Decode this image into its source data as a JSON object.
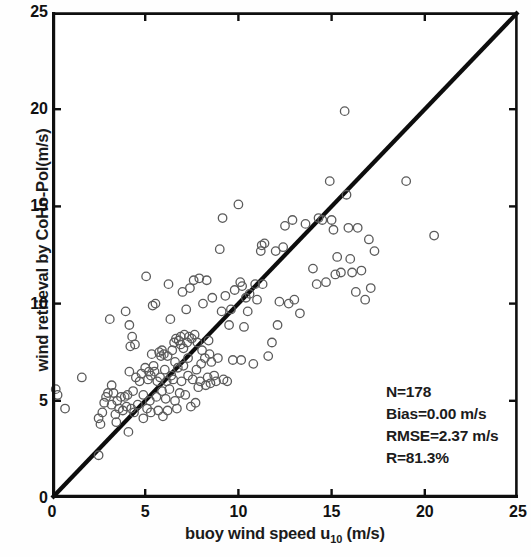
{
  "chart_data": {
    "type": "scatter",
    "title": "",
    "xlabel": "buoy wind speed u10 (m/s)",
    "xlabel_main": "buoy wind speed u",
    "xlabel_sub": "10",
    "xlabel_unit": " (m/s)",
    "ylabel": "wind retrieval by CoHo-Pol(m/s)",
    "xlim": [
      0,
      25
    ],
    "ylim": [
      0,
      25
    ],
    "xticks": [
      0,
      5,
      10,
      15,
      20,
      25
    ],
    "yticks": [
      0,
      5,
      10,
      15,
      20,
      25
    ],
    "xtick_labels": [
      "0",
      "5",
      "10",
      "15",
      "20",
      "25"
    ],
    "ytick_labels": [
      "0",
      "5",
      "10",
      "15",
      "20",
      "25"
    ],
    "grid": false,
    "legend": null,
    "marker": {
      "shape": "open-circle",
      "diameter_px": 8.5,
      "stroke": "#5b5b5b",
      "stroke_width": 1.3,
      "fill": "none"
    },
    "reference_line": {
      "name": "one-to-one line",
      "from": [
        0,
        0
      ],
      "to": [
        25,
        25
      ],
      "color": "#0d0d0d",
      "width_px": 4.2
    },
    "annotations": [
      "N=178",
      "Bias=0.00 m/s",
      "RMSE=2.37 m/s",
      "R=81.3%"
    ],
    "stats": {
      "n_label": "N=178",
      "bias_label": "Bias=0.00 m/s",
      "rmse_label": "RMSE=2.37 m/s",
      "r_label": "R=81.3%",
      "n": 178,
      "bias": 0.0,
      "rmse": 2.37,
      "r_percent": 81.3
    },
    "points": [
      [
        0.2,
        5.6
      ],
      [
        0.3,
        5.3
      ],
      [
        0.7,
        4.6
      ],
      [
        1.6,
        6.2
      ],
      [
        2.5,
        4.1
      ],
      [
        2.5,
        2.2
      ],
      [
        2.6,
        3.8
      ],
      [
        2.7,
        4.4
      ],
      [
        2.9,
        5.2
      ],
      [
        3.0,
        5.4
      ],
      [
        3.1,
        9.2
      ],
      [
        3.2,
        4.8
      ],
      [
        3.3,
        5.4
      ],
      [
        3.4,
        4.3
      ],
      [
        3.5,
        5.0
      ],
      [
        3.6,
        4.6
      ],
      [
        3.7,
        5.2
      ],
      [
        3.8,
        4.5
      ],
      [
        3.9,
        5.2
      ],
      [
        3.95,
        9.6
      ],
      [
        4.0,
        4.7
      ],
      [
        4.05,
        5.3
      ],
      [
        4.1,
        3.4
      ],
      [
        4.15,
        8.9
      ],
      [
        4.2,
        7.8
      ],
      [
        4.25,
        4.6
      ],
      [
        4.3,
        8.3
      ],
      [
        4.35,
        5.5
      ],
      [
        4.4,
        4.4
      ],
      [
        4.5,
        6.2
      ],
      [
        4.6,
        4.8
      ],
      [
        4.7,
        6.0
      ],
      [
        4.8,
        6.4
      ],
      [
        4.9,
        5.3
      ],
      [
        5.0,
        6.7
      ],
      [
        5.05,
        11.4
      ],
      [
        5.1,
        4.6
      ],
      [
        5.15,
        6.1
      ],
      [
        5.2,
        6.5
      ],
      [
        5.25,
        5.0
      ],
      [
        5.3,
        6.3
      ],
      [
        5.35,
        7.4
      ],
      [
        5.4,
        9.9
      ],
      [
        5.5,
        6.5
      ],
      [
        5.55,
        10.0
      ],
      [
        5.6,
        5.2
      ],
      [
        5.65,
        6.0
      ],
      [
        5.7,
        4.5
      ],
      [
        5.75,
        7.5
      ],
      [
        5.8,
        6.2
      ],
      [
        5.85,
        7.3
      ],
      [
        5.9,
        5.5
      ],
      [
        5.95,
        4.2
      ],
      [
        6.0,
        7.4
      ],
      [
        6.05,
        6.6
      ],
      [
        6.1,
        5.1
      ],
      [
        6.15,
        6.0
      ],
      [
        6.2,
        7.3
      ],
      [
        6.25,
        11.0
      ],
      [
        6.3,
        5.6
      ],
      [
        6.35,
        9.2
      ],
      [
        6.4,
        6.3
      ],
      [
        6.5,
        6.1
      ],
      [
        6.55,
        8.0
      ],
      [
        6.6,
        5.0
      ],
      [
        6.65,
        8.2
      ],
      [
        6.7,
        4.6
      ],
      [
        6.75,
        6.7
      ],
      [
        6.8,
        8.1
      ],
      [
        6.85,
        5.4
      ],
      [
        6.9,
        8.3
      ],
      [
        6.95,
        6.0
      ],
      [
        7.0,
        10.6
      ],
      [
        7.05,
        6.8
      ],
      [
        7.1,
        8.4
      ],
      [
        7.15,
        5.3
      ],
      [
        7.2,
        9.7
      ],
      [
        7.25,
        8.0
      ],
      [
        7.3,
        6.3
      ],
      [
        7.35,
        8.3
      ],
      [
        7.4,
        10.8
      ],
      [
        7.45,
        4.7
      ],
      [
        7.5,
        8.2
      ],
      [
        7.55,
        6.1
      ],
      [
        7.6,
        11.2
      ],
      [
        7.65,
        8.4
      ],
      [
        7.7,
        4.9
      ],
      [
        7.75,
        6.6
      ],
      [
        7.8,
        8.0
      ],
      [
        7.85,
        5.7
      ],
      [
        7.9,
        11.3
      ],
      [
        7.95,
        6.0
      ],
      [
        8.0,
        6.9
      ],
      [
        8.1,
        10.0
      ],
      [
        8.2,
        7.2
      ],
      [
        8.25,
        5.8
      ],
      [
        8.3,
        11.2
      ],
      [
        8.35,
        6.2
      ],
      [
        8.4,
        8.1
      ],
      [
        8.5,
        5.9
      ],
      [
        8.55,
        7.0
      ],
      [
        8.6,
        10.3
      ],
      [
        8.7,
        6.3
      ],
      [
        8.8,
        6.0
      ],
      [
        8.9,
        7.2
      ],
      [
        9.0,
        12.8
      ],
      [
        9.1,
        9.6
      ],
      [
        9.15,
        14.4
      ],
      [
        9.2,
        6.1
      ],
      [
        9.3,
        10.4
      ],
      [
        9.4,
        6.0
      ],
      [
        9.5,
        8.9
      ],
      [
        9.6,
        9.7
      ],
      [
        9.8,
        10.7
      ],
      [
        10.0,
        15.1
      ],
      [
        10.1,
        11.1
      ],
      [
        10.15,
        7.1
      ],
      [
        10.2,
        10.9
      ],
      [
        10.3,
        8.8
      ],
      [
        10.4,
        10.3
      ],
      [
        10.5,
        9.6
      ],
      [
        10.6,
        10.5
      ],
      [
        10.8,
        6.9
      ],
      [
        11.0,
        10.2
      ],
      [
        11.2,
        12.7
      ],
      [
        11.25,
        13.0
      ],
      [
        11.3,
        11.0
      ],
      [
        11.4,
        13.1
      ],
      [
        11.6,
        7.3
      ],
      [
        11.8,
        8.0
      ],
      [
        12.0,
        12.7
      ],
      [
        12.2,
        10.1
      ],
      [
        12.4,
        12.9
      ],
      [
        12.5,
        14.0
      ],
      [
        12.7,
        10.0
      ],
      [
        12.9,
        14.3
      ],
      [
        13.0,
        10.2
      ],
      [
        13.3,
        9.5
      ],
      [
        14.0,
        11.8
      ],
      [
        14.2,
        11.0
      ],
      [
        14.3,
        14.4
      ],
      [
        14.5,
        14.3
      ],
      [
        14.7,
        11.1
      ],
      [
        14.9,
        16.3
      ],
      [
        15.0,
        14.3
      ],
      [
        15.2,
        11.5
      ],
      [
        15.3,
        12.4
      ],
      [
        15.5,
        11.6
      ],
      [
        15.7,
        19.9
      ],
      [
        15.8,
        15.6
      ],
      [
        15.9,
        13.9
      ],
      [
        16.1,
        11.6
      ],
      [
        16.3,
        10.6
      ],
      [
        16.4,
        13.9
      ],
      [
        16.6,
        11.7
      ],
      [
        16.8,
        10.2
      ],
      [
        17.0,
        13.3
      ],
      [
        17.1,
        10.8
      ],
      [
        17.3,
        12.7
      ],
      [
        19.0,
        16.3
      ],
      [
        20.5,
        13.5
      ],
      [
        4.45,
        7.9
      ],
      [
        5.45,
        6.8
      ],
      [
        6.45,
        7.6
      ],
      [
        7.05,
        7.7
      ],
      [
        8.05,
        7.6
      ],
      [
        3.45,
        3.9
      ],
      [
        4.9,
        4.1
      ],
      [
        5.3,
        4.4
      ],
      [
        6.2,
        4.5
      ],
      [
        6.9,
        7.9
      ],
      [
        8.45,
        7.4
      ],
      [
        9.7,
        7.1
      ],
      [
        10.9,
        11.0
      ],
      [
        12.1,
        8.9
      ],
      [
        13.6,
        14.1
      ],
      [
        15.1,
        13.8
      ],
      [
        16.0,
        12.3
      ],
      [
        5.9,
        7.6
      ],
      [
        6.6,
        7.0
      ],
      [
        7.3,
        7.2
      ],
      [
        4.15,
        6.5
      ],
      [
        3.2,
        5.8
      ],
      [
        2.8,
        4.9
      ]
    ]
  }
}
